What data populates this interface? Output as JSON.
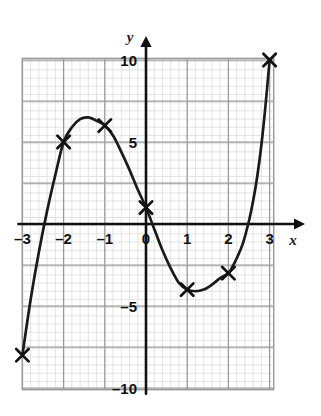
{
  "figure": {
    "background_color": "#ffffff",
    "grid_color_minor": "#d8d8d8",
    "grid_color_major": "#9a9a9a",
    "axis_color": "#111111",
    "curve_color": "#1a1a1a",
    "marker_color": "#111111",
    "grid_left_x": -3.0,
    "grid_right_x": 3.1,
    "grid_top_y": 10.1,
    "grid_bottom_y": -10.1
  },
  "chart_data": {
    "type": "line",
    "title": "",
    "xlabel": "x",
    "ylabel": "y",
    "xlim": [
      -3.0,
      3.1
    ],
    "ylim": [
      -10.1,
      10.1
    ],
    "grid": true,
    "legend": null,
    "xticks": [
      -3,
      -2,
      -1,
      0,
      1,
      2,
      3
    ],
    "xtick_labels": [
      "–3",
      "–2",
      "–1",
      "0",
      "1",
      "2",
      "3"
    ],
    "yticks": [
      10,
      5,
      -5,
      -10
    ],
    "ytick_labels": [
      "10",
      "5",
      "–5",
      "–10"
    ],
    "minor_grid_step_x": 0.2,
    "minor_grid_step_y": 0.5,
    "major_grid_step_x": 1.0,
    "major_grid_step_y": 2.5,
    "series": [
      {
        "name": "cubic curve",
        "marker": "x",
        "points": [
          {
            "x": -3,
            "y": -8
          },
          {
            "x": -2,
            "y": 5
          },
          {
            "x": -1,
            "y": 6
          },
          {
            "x": 0,
            "y": 1
          },
          {
            "x": 1,
            "y": -4
          },
          {
            "x": 2,
            "y": -3
          },
          {
            "x": 3,
            "y": 10
          }
        ],
        "curve_samples": [
          {
            "x": -3.0,
            "y": -8.0
          },
          {
            "x": -2.8,
            "y": -4.6
          },
          {
            "x": -2.6,
            "y": -1.7
          },
          {
            "x": -2.4,
            "y": 0.8
          },
          {
            "x": -2.2,
            "y": 3.0
          },
          {
            "x": -2.0,
            "y": 5.0
          },
          {
            "x": -1.8,
            "y": 5.9
          },
          {
            "x": -1.6,
            "y": 6.4
          },
          {
            "x": -1.4,
            "y": 6.5
          },
          {
            "x": -1.2,
            "y": 6.3
          },
          {
            "x": -1.0,
            "y": 6.0
          },
          {
            "x": -0.8,
            "y": 5.4
          },
          {
            "x": -0.6,
            "y": 4.4
          },
          {
            "x": -0.4,
            "y": 3.3
          },
          {
            "x": -0.2,
            "y": 2.1
          },
          {
            "x": 0.0,
            "y": 1.0
          },
          {
            "x": 0.2,
            "y": -0.3
          },
          {
            "x": 0.4,
            "y": -1.6
          },
          {
            "x": 0.6,
            "y": -2.7
          },
          {
            "x": 0.8,
            "y": -3.6
          },
          {
            "x": 1.0,
            "y": -4.0
          },
          {
            "x": 1.2,
            "y": -4.1
          },
          {
            "x": 1.4,
            "y": -4.0
          },
          {
            "x": 1.6,
            "y": -3.7
          },
          {
            "x": 1.8,
            "y": -3.3
          },
          {
            "x": 2.0,
            "y": -3.0
          },
          {
            "x": 2.1,
            "y": -2.6
          },
          {
            "x": 2.2,
            "y": -2.1
          },
          {
            "x": 2.35,
            "y": -1.2
          },
          {
            "x": 2.5,
            "y": 0.2
          },
          {
            "x": 2.6,
            "y": 1.4
          },
          {
            "x": 2.7,
            "y": 2.9
          },
          {
            "x": 2.8,
            "y": 4.8
          },
          {
            "x": 2.9,
            "y": 7.2
          },
          {
            "x": 3.0,
            "y": 10.0
          }
        ]
      }
    ]
  },
  "axes": {
    "x_axis_label": "x",
    "y_axis_label": "y"
  }
}
